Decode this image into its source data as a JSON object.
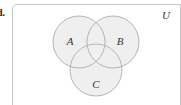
{
  "problem_label": "d.",
  "universe_label": "U",
  "sets": [
    {
      "name": "A",
      "cx": 79,
      "cy": 42,
      "r": 26,
      "lx": 70,
      "ly": 41
    },
    {
      "name": "B",
      "cx": 113,
      "cy": 42,
      "r": 26,
      "lx": 120,
      "ly": 41
    },
    {
      "name": "C",
      "cx": 96,
      "cy": 70,
      "r": 26,
      "lx": 96,
      "ly": 84
    }
  ],
  "colors": {
    "fill": "#efefef",
    "stroke": "#b5b5b5",
    "border": "#c8c8c8"
  }
}
